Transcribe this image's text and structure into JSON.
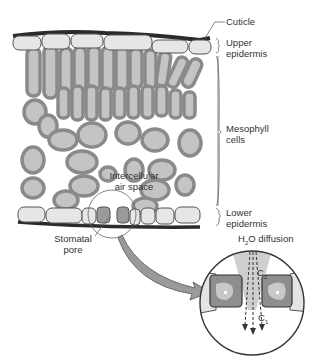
{
  "diagram": {
    "labels": {
      "cuticle": "Cuticle",
      "upper_epidermis_1": "Upper",
      "upper_epidermis_2": "epidermis",
      "mesophyll_1": "Mesophyll",
      "mesophyll_2": "cells",
      "intercellular_1": "Intercellular",
      "intercellular_2": "air space",
      "lower_epidermis_1": "Lower",
      "lower_epidermis_2": "epidermis",
      "stomatal_1": "Stomatal",
      "stomatal_2": "pore",
      "h2o_prefix": "H",
      "h2o_sub": "2",
      "h2o_suffix": "O diffusion",
      "c2_main": "C",
      "c2_sub": "2",
      "c1_main": "C",
      "c1_sub": "1"
    },
    "colors": {
      "cuticle": "#2b2b2b",
      "epidermis_fill": "#e6e6e6",
      "mesophyll_outer": "#8a8a8a",
      "mesophyll_inner": "#c4c4c4",
      "guard_cell": "#8e8e8e",
      "arrow": "#9a9a9a"
    }
  }
}
